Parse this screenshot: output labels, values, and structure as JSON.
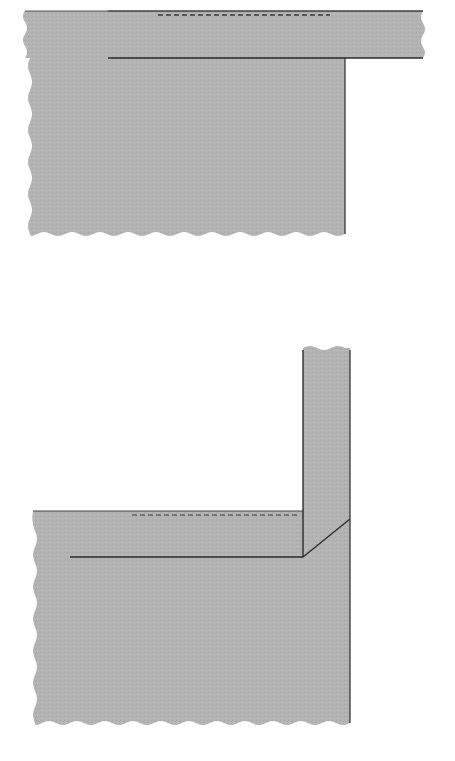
{
  "diagram": {
    "type": "sewing-seam-illustration",
    "colors": {
      "fabric": "#b4b4b4",
      "fabric_edge": "#a8a8a8",
      "seam_line": "#2a2a2a",
      "stitch_line": "#3a3a3a",
      "background": "#ffffff"
    },
    "panels": [
      {
        "name": "top-figure",
        "description": "Fabric strip laid over fabric panel with stitching line, unfolded",
        "elements": [
          "strip",
          "panel",
          "stitch-dashed-line",
          "seam-line"
        ]
      },
      {
        "name": "bottom-figure",
        "description": "Strip folded upward at a right angle with mitered diagonal fold",
        "elements": [
          "panel",
          "folded-strip",
          "miter-diagonal",
          "stitch-dashed-line",
          "seam-line"
        ]
      }
    ]
  }
}
